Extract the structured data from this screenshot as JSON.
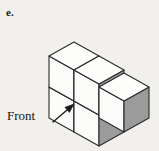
{
  "figure": {
    "part_label": "e.",
    "front_label": "Front",
    "background_color": "#f2f0ed",
    "colors": {
      "top_face": "#fdfdfc",
      "left_face": "#fbfbfa",
      "right_face": "#9b9b9b",
      "edge": "#2b2b2b",
      "arrow": "#1a1a1a",
      "text": "#141414"
    },
    "annotation": {
      "arrow_from": [
        53,
        122
      ],
      "arrow_to": [
        74,
        104
      ],
      "arrow_name": "front-pointer-arrow"
    },
    "projection": {
      "type": "isometric",
      "unit_x": [
        25,
        14
      ],
      "unit_y": [
        -25,
        14
      ],
      "unit_z": [
        0,
        -31
      ],
      "origin": [
        74,
        104
      ]
    },
    "cubes": [
      {
        "name": "cube-front-bottom-left",
        "pos": [
          0,
          0,
          0
        ]
      },
      {
        "name": "cube-back-bottom-right",
        "pos": [
          1,
          0,
          0
        ]
      },
      {
        "name": "cube-front-top-left",
        "pos": [
          0,
          0,
          1
        ]
      },
      {
        "name": "cube-back-top-right",
        "pos": [
          1,
          0,
          1
        ]
      },
      {
        "name": "cube-right-side-lower",
        "pos": [
          1,
          -1,
          0
        ]
      }
    ],
    "cube_count": 5
  }
}
